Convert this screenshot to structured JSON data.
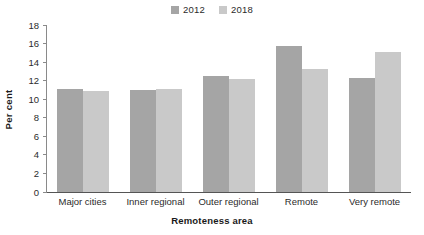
{
  "chart_data": {
    "type": "bar",
    "title": "",
    "xlabel": "Remoteness area",
    "ylabel": "Per cent",
    "ylim": [
      0,
      18
    ],
    "yticks": [
      0,
      2,
      4,
      6,
      8,
      10,
      12,
      14,
      16,
      18
    ],
    "grid": false,
    "legend_position": "top-center",
    "categories": [
      "Major cities",
      "Inner regional",
      "Outer regional",
      "Remote",
      "Very remote"
    ],
    "series": [
      {
        "name": "2012",
        "color": "#a5a5a5",
        "values": [
          11.1,
          11.0,
          12.5,
          15.7,
          12.3
        ]
      },
      {
        "name": "2018",
        "color": "#c9c9c9",
        "values": [
          10.9,
          11.1,
          12.2,
          13.3,
          15.1
        ]
      }
    ]
  }
}
